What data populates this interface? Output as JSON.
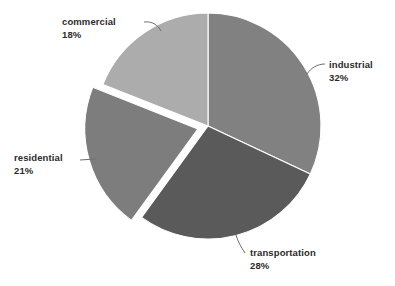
{
  "chart_data": {
    "type": "pie",
    "title": "",
    "subtitle": "",
    "xlabel": "",
    "ylabel": "",
    "grid": false,
    "legend_position": "none",
    "label_style": "external-with-leader-lines",
    "start_angle_deg": 0,
    "direction": "clockwise",
    "total_percent": 99,
    "categories": [
      "industrial",
      "transportation",
      "residential",
      "commercial"
    ],
    "values": [
      32,
      28,
      21,
      18
    ],
    "slices": [
      {
        "label": "industrial",
        "percent_text": "32%",
        "value": 32,
        "color": "#818181",
        "exploded": false,
        "start_deg": 0,
        "end_deg": 115.2
      },
      {
        "label": "transportation",
        "percent_text": "28%",
        "value": 28,
        "color": "#5a5a5a",
        "exploded": false,
        "start_deg": 115.2,
        "end_deg": 216.0
      },
      {
        "label": "residential",
        "percent_text": "21%",
        "value": 21,
        "color": "#7d7d7d",
        "exploded": true,
        "start_deg": 216.0,
        "end_deg": 291.6
      },
      {
        "label": "commercial",
        "percent_text": "18%",
        "value": 18,
        "color": "#acacac",
        "exploded": false,
        "start_deg": 291.6,
        "end_deg": 360.0
      }
    ],
    "colors": {
      "background": "#ffffff",
      "text": "#2b2b2b",
      "leader_line": "#6e6e6e",
      "slice_divider": "#ffffff"
    }
  }
}
